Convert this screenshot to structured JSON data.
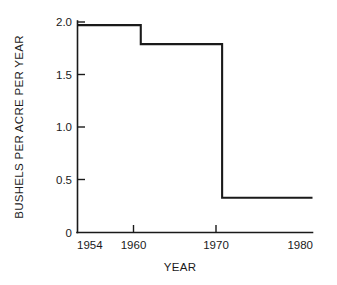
{
  "chart_data": {
    "type": "line",
    "subtype": "step",
    "title": "",
    "xlabel": "YEAR",
    "ylabel": "BUSHELS PER ACRE PER YEAR",
    "xlim": [
      1954,
      1980
    ],
    "ylim": [
      0,
      2.0
    ],
    "grid": false,
    "legend": null,
    "x_tick_labels": [
      "1954",
      "1960",
      "1970",
      "1980"
    ],
    "x_ticks": [
      1954,
      1960,
      1970,
      1980
    ],
    "y_tick_labels": [
      "0",
      "0.5",
      "1.0",
      "1.5",
      "2.0"
    ],
    "y_ticks": [
      0,
      0.5,
      1.0,
      1.5,
      2.0
    ],
    "series": [
      {
        "name": "Bushels per acre per year",
        "steps": [
          {
            "x_start": 1954,
            "x_end": 1961,
            "value": 1.97
          },
          {
            "x_start": 1961,
            "x_end": 1970,
            "value": 1.79
          },
          {
            "x_start": 1970,
            "x_end": 1980,
            "value": 0.33
          }
        ],
        "x": [
          1954,
          1961,
          1961,
          1970,
          1970,
          1980
        ],
        "y": [
          1.97,
          1.97,
          1.79,
          1.79,
          0.33,
          0.33
        ],
        "color": "#1a1a1a"
      }
    ]
  },
  "axes": {
    "y_labels": {
      "t0": "0",
      "t1": "0.5",
      "t2": "1.0",
      "t3": "1.5",
      "t4": "2.0"
    },
    "x_labels": {
      "t0": "1954",
      "t1": "1960",
      "t2": "1970",
      "t3": "1980"
    },
    "x_title": "YEAR",
    "y_title": "BUSHELS PER ACRE PER YEAR"
  },
  "colors": {
    "line": "#1a1a1a",
    "axis": "#1a1a1a",
    "text": "#1a1a1a",
    "background": "#ffffff"
  }
}
